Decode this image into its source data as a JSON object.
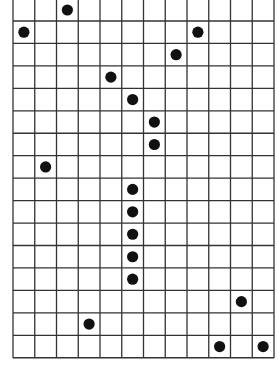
{
  "board": {
    "columns": 12,
    "rows_visible": 16,
    "top_row_partially_cropped": true,
    "line_color": "#333333",
    "background_color": "#ffffff",
    "dot_color": "#111111",
    "dots": [
      {
        "col": 2,
        "row": 0
      },
      {
        "col": 0,
        "row": 1
      },
      {
        "col": 8,
        "row": 1
      },
      {
        "col": 7,
        "row": 2
      },
      {
        "col": 4,
        "row": 3
      },
      {
        "col": 5,
        "row": 4
      },
      {
        "col": 6,
        "row": 5
      },
      {
        "col": 6,
        "row": 6
      },
      {
        "col": 1,
        "row": 7
      },
      {
        "col": 5,
        "row": 8
      },
      {
        "col": 5,
        "row": 9
      },
      {
        "col": 5,
        "row": 10
      },
      {
        "col": 5,
        "row": 11
      },
      {
        "col": 5,
        "row": 12
      },
      {
        "col": 10,
        "row": 13
      },
      {
        "col": 3,
        "row": 14
      },
      {
        "col": 9,
        "row": 15
      },
      {
        "col": 11,
        "row": 15
      }
    ]
  }
}
